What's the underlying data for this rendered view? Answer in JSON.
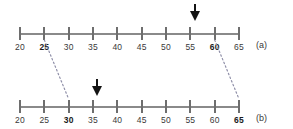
{
  "figure": {
    "axis_color": "#8a8a8a",
    "tick_color": "#6e6e6e",
    "label_color": "#3a3a3a",
    "arrow_color": "#141414",
    "connector_color": "#8f8fa8",
    "background": "#ffffff"
  },
  "rows": [
    {
      "id": "a",
      "side_label": "(a)",
      "axis_min": 20,
      "axis_max": 65,
      "tick_step": 5,
      "tick_labels": [
        "20",
        "25",
        "30",
        "35",
        "40",
        "45",
        "50",
        "55",
        "60",
        "65"
      ],
      "bold_labels": [
        "25",
        "60"
      ],
      "marker_value": "56",
      "marker_name": "down-arrow-marker-a"
    },
    {
      "id": "b",
      "side_label": "(b)",
      "axis_min": 20,
      "axis_max": 65,
      "tick_step": 5,
      "tick_labels": [
        "20",
        "25",
        "30",
        "35",
        "40",
        "45",
        "50",
        "55",
        "60",
        "65"
      ],
      "bold_labels": [
        "30",
        "65"
      ],
      "marker_value": "36",
      "marker_name": "down-arrow-marker-b"
    }
  ],
  "connectors": [
    {
      "name": "connector-left",
      "from_value": "25",
      "to_value": "30"
    },
    {
      "name": "connector-right",
      "from_value": "60",
      "to_value": "65"
    }
  ],
  "chart_data": {
    "type": "line",
    "title": "",
    "xlabel": "",
    "ylabel": "",
    "grid": false,
    "legend": "none",
    "axes": [
      {
        "name": "(a)",
        "xlim": [
          20,
          65
        ],
        "ticks": [
          20,
          25,
          30,
          35,
          40,
          45,
          50,
          55,
          60,
          65
        ],
        "tick_labels": [
          "20",
          "25",
          "30",
          "35",
          "40",
          "45",
          "50",
          "55",
          "60",
          "65"
        ],
        "highlighted_ticks": [
          25,
          60
        ],
        "marker": {
          "type": "down-arrow",
          "value": 56
        }
      },
      {
        "name": "(b)",
        "xlim": [
          20,
          65
        ],
        "ticks": [
          20,
          25,
          30,
          35,
          40,
          45,
          50,
          55,
          60,
          65
        ],
        "tick_labels": [
          "20",
          "25",
          "30",
          "35",
          "40",
          "45",
          "50",
          "55",
          "60",
          "65"
        ],
        "highlighted_ticks": [
          30,
          65
        ],
        "marker": {
          "type": "down-arrow",
          "value": 36
        }
      }
    ],
    "mappings": [
      {
        "from_axis": "(a)",
        "from": 25,
        "to_axis": "(b)",
        "to": 30
      },
      {
        "from_axis": "(a)",
        "from": 60,
        "to_axis": "(b)",
        "to": 65
      }
    ]
  }
}
